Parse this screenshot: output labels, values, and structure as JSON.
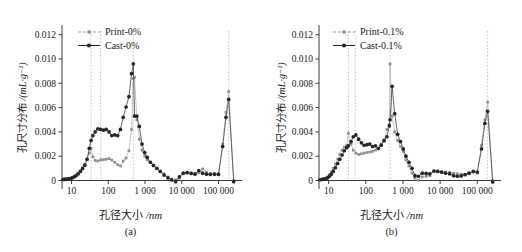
{
  "figure": {
    "axis_labels": {
      "y": "孔尺寸分布 /(mL·g⁻¹)",
      "y_cn": "孔尺寸分布",
      "y_unit": "/(mL·g⁻¹)",
      "x": "孔径大小 /nm",
      "x_cn": "孔径大小",
      "x_unit": "/nm"
    },
    "y_ticks": [
      "0",
      "0.002",
      "0.004",
      "0.006",
      "0.008",
      "0.010",
      "0.012"
    ],
    "x_ticks": [
      "10",
      "100",
      "1 000",
      "10 000",
      "100 000"
    ],
    "colors": {
      "print": "#8f8f8f",
      "cast": "#262626",
      "axis": "#3a3a3a",
      "guide": "#b4b4b4",
      "background": "#ffffff"
    }
  },
  "panels": [
    {
      "caption": "(a)",
      "name": "panel-a"
    },
    {
      "caption": "(b)",
      "name": "panel-b"
    }
  ],
  "chart_data": [
    {
      "type": "line",
      "panel": "(a)",
      "title": "",
      "xlabel": "孔径大小 /nm",
      "ylabel": "孔尺寸分布 /(mL·g⁻¹)",
      "xscale": "log",
      "xlim": [
        5.5,
        300000
      ],
      "ylim": [
        -0.0007,
        0.0128
      ],
      "yticks": [
        0,
        0.002,
        0.004,
        0.006,
        0.008,
        0.01,
        0.012
      ],
      "xticks": [
        10,
        100,
        1000,
        10000,
        100000
      ],
      "grid": false,
      "legend_position": "top-left",
      "guides_x": [
        34,
        62,
        480,
        190000
      ],
      "series": [
        {
          "name": "Print-0%",
          "color": "#8f8f8f",
          "x": [
            5.8,
            6.4,
            7.0,
            7.7,
            8.5,
            9.4,
            10.5,
            11.8,
            13.3,
            15.2,
            17.5,
            20.0,
            23.0,
            26.5,
            30.5,
            34.0,
            38.0,
            44.0,
            52.0,
            62.0,
            74.0,
            88.0,
            105.0,
            125.0,
            150.0,
            180.0,
            215.0,
            255.0,
            305.0,
            365.0,
            430.0,
            480.0,
            520.0,
            600.0,
            700.0,
            830.0,
            980.0,
            1150.0,
            1400.0,
            1700.0,
            2100.0,
            2600.0,
            3300.0,
            4200.0,
            5300.0,
            6800.0,
            8600.0,
            11000.0,
            14000.0,
            18000.0,
            23000.0,
            29000.0,
            37000.0,
            47000.0,
            60000.0,
            78000.0,
            100000.0,
            130000.0,
            160000.0,
            190000.0,
            260000.0
          ],
          "y": [
            0.0001,
            0.00012,
            0.00013,
            0.00014,
            0.00016,
            0.0002,
            0.00026,
            0.00034,
            0.00045,
            0.0006,
            0.0008,
            0.00105,
            0.00135,
            0.00175,
            0.00225,
            0.00265,
            0.00195,
            0.00165,
            0.0016,
            0.0017,
            0.00172,
            0.00175,
            0.0018,
            0.00168,
            0.0015,
            0.0013,
            0.0012,
            0.0016,
            0.00185,
            0.00245,
            0.0042,
            0.0084,
            0.0085,
            0.005,
            0.0034,
            0.0025,
            0.002,
            0.0017,
            0.0015,
            0.0012,
            0.001,
            0.00075,
            0.00055,
            0.0003,
            0.0001,
            5e-05,
            0.0002,
            0.00055,
            0.00062,
            0.00062,
            0.0006,
            0.00063,
            0.00095,
            0.0007,
            0.00058,
            0.00055,
            0.00055,
            0.003,
            0.0056,
            0.00732,
            0.0
          ]
        },
        {
          "name": "Cast-0%",
          "color": "#262626",
          "x": [
            5.8,
            6.4,
            7.0,
            7.7,
            8.5,
            9.4,
            10.5,
            11.8,
            13.3,
            15.2,
            17.5,
            20.0,
            23.0,
            26.5,
            30.5,
            34.0,
            38.0,
            44.0,
            52.0,
            62.0,
            74.0,
            88.0,
            105.0,
            125.0,
            150.0,
            180.0,
            215.0,
            255.0,
            305.0,
            365.0,
            430.0,
            480.0,
            520.0,
            600.0,
            700.0,
            830.0,
            980.0,
            1150.0,
            1400.0,
            1700.0,
            2100.0,
            2600.0,
            3300.0,
            4200.0,
            5300.0,
            6800.0,
            8600.0,
            11000.0,
            14000.0,
            18000.0,
            23000.0,
            29000.0,
            37000.0,
            47000.0,
            60000.0,
            78000.0,
            100000.0,
            130000.0,
            160000.0,
            190000.0,
            260000.0
          ],
          "y": [
            8e-05,
            9e-05,
            0.0001,
            0.00011,
            0.00013,
            0.00016,
            0.00022,
            0.0003,
            0.0004,
            0.00055,
            0.00075,
            0.00098,
            0.00125,
            0.00175,
            0.00265,
            0.0033,
            0.0037,
            0.004,
            0.00425,
            0.0042,
            0.00415,
            0.0042,
            0.004,
            0.0037,
            0.00375,
            0.0037,
            0.0042,
            0.0052,
            0.00605,
            0.0069,
            0.0088,
            0.0096,
            0.0053,
            0.0053,
            0.00445,
            0.003,
            0.0023,
            0.0019,
            0.0015,
            0.00125,
            0.001,
            0.00075,
            0.00045,
            0.00022,
            5e-05,
            -0.0001,
            0.0003,
            0.0006,
            0.00065,
            0.00058,
            0.00052,
            0.00082,
            0.0006,
            0.00052,
            0.0005,
            0.00052,
            0.0005,
            0.0028,
            0.0052,
            0.00668,
            -0.0001
          ]
        }
      ]
    },
    {
      "type": "line",
      "panel": "(b)",
      "title": "",
      "xlabel": "孔径大小 /nm",
      "ylabel": "孔尺寸分布 /(mL·g⁻¹)",
      "xscale": "log",
      "xlim": [
        5.5,
        300000
      ],
      "ylim": [
        -0.0007,
        0.0128
      ],
      "yticks": [
        0,
        0.002,
        0.004,
        0.006,
        0.008,
        0.01,
        0.012
      ],
      "xticks": [
        10,
        100,
        1000,
        10000,
        100000
      ],
      "grid": false,
      "legend_position": "top-left",
      "guides_x": [
        34,
        52,
        450,
        190000
      ],
      "series": [
        {
          "name": "Print-0.1%",
          "color": "#8f8f8f",
          "x": [
            5.8,
            6.4,
            7.0,
            7.7,
            8.5,
            9.4,
            10.5,
            11.8,
            13.3,
            15.2,
            17.5,
            20.0,
            23.0,
            26.5,
            30.5,
            34.0,
            40.0,
            46.0,
            54.0,
            64.0,
            76.0,
            90.0,
            108.0,
            128.0,
            152.0,
            182.0,
            218.0,
            260.0,
            310.0,
            370.0,
            430.0,
            450.0,
            510.0,
            600.0,
            720.0,
            860.0,
            1020.0,
            1200.0,
            1450.0,
            1750.0,
            2100.0,
            2600.0,
            3300.0,
            4200.0,
            5300.0,
            6800.0,
            8600.0,
            11000.0,
            14000.0,
            18000.0,
            23000.0,
            29000.0,
            37000.0,
            47000.0,
            60000.0,
            78000.0,
            100000.0,
            130000.0,
            160000.0,
            190000.0,
            260000.0
          ],
          "y": [
            8e-05,
            0.0001,
            0.00012,
            0.00015,
            0.0002,
            0.0003,
            0.00048,
            0.00072,
            0.001,
            0.00135,
            0.00175,
            0.00215,
            0.0025,
            0.00275,
            0.0029,
            0.0039,
            0.003,
            0.0025,
            0.00225,
            0.00215,
            0.0022,
            0.00225,
            0.0023,
            0.00235,
            0.0024,
            0.0025,
            0.0026,
            0.003,
            0.0032,
            0.0042,
            0.0046,
            0.0096,
            0.0053,
            0.004,
            0.0033,
            0.0028,
            0.0024,
            0.0017,
            0.0012,
            0.0006,
            0.0002,
            2e-05,
            0.0003,
            0.00035,
            0.0004,
            0.00075,
            0.00078,
            0.00075,
            0.0007,
            0.00068,
            0.0006,
            0.00055,
            0.00052,
            0.0005,
            0.00055,
            0.0007,
            0.0006,
            0.0029,
            0.005,
            0.00645,
            0.0
          ]
        },
        {
          "name": "Cast-0.1%",
          "color": "#262626",
          "x": [
            5.8,
            6.4,
            7.0,
            7.7,
            8.5,
            9.4,
            10.5,
            11.8,
            13.3,
            15.2,
            17.5,
            20.0,
            23.0,
            26.5,
            30.5,
            34.0,
            40.0,
            46.0,
            54.0,
            64.0,
            76.0,
            90.0,
            108.0,
            128.0,
            152.0,
            182.0,
            218.0,
            260.0,
            310.0,
            370.0,
            430.0,
            450.0,
            510.0,
            600.0,
            720.0,
            860.0,
            1020.0,
            1200.0,
            1450.0,
            1750.0,
            2100.0,
            2600.0,
            3300.0,
            4200.0,
            5300.0,
            6800.0,
            8600.0,
            11000.0,
            14000.0,
            18000.0,
            23000.0,
            29000.0,
            37000.0,
            47000.0,
            60000.0,
            78000.0,
            100000.0,
            130000.0,
            160000.0,
            190000.0,
            260000.0
          ],
          "y": [
            6e-05,
            8e-05,
            0.0001,
            0.00012,
            0.00016,
            0.00022,
            0.00035,
            0.00052,
            0.00075,
            0.00105,
            0.0014,
            0.00175,
            0.0021,
            0.00245,
            0.0027,
            0.00285,
            0.0032,
            0.0036,
            0.00375,
            0.0034,
            0.0031,
            0.0029,
            0.00295,
            0.003,
            0.0028,
            0.00285,
            0.00265,
            0.0029,
            0.0033,
            0.0036,
            0.0045,
            0.005,
            0.00775,
            0.0055,
            0.0038,
            0.0032,
            0.0026,
            0.002,
            0.0015,
            0.001,
            0.0004,
            0.00035,
            0.0006,
            0.00058,
            0.00055,
            0.00078,
            0.00075,
            0.00068,
            0.0006,
            0.00055,
            0.0004,
            0.00035,
            0.00038,
            0.00048,
            0.0006,
            0.00075,
            0.0007,
            0.0026,
            0.0047,
            0.0057,
            -0.00012
          ]
        }
      ]
    }
  ],
  "legends": [
    {
      "panel": "(a)",
      "entries": [
        {
          "label": "Print-0%",
          "marker": "square",
          "color": "#8f8f8f"
        },
        {
          "label": "Cast-0%",
          "marker": "circle",
          "color": "#262626"
        }
      ]
    },
    {
      "panel": "(b)",
      "entries": [
        {
          "label": "Print-0.1%",
          "marker": "square",
          "color": "#8f8f8f"
        },
        {
          "label": "Cast-0.1%",
          "marker": "circle",
          "color": "#262626"
        }
      ]
    }
  ]
}
